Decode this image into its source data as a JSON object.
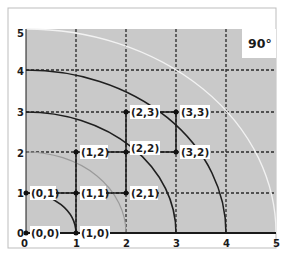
{
  "diagram": {
    "angle_label": "90°",
    "x_ticks": [
      "0",
      "1",
      "2",
      "3",
      "4",
      "5"
    ],
    "y_ticks": [
      "0",
      "1",
      "2",
      "3",
      "4",
      "5"
    ],
    "points": [
      {
        "label": "(0,0)",
        "x": 0,
        "y": 0
      },
      {
        "label": "(1,0)",
        "x": 1,
        "y": 0
      },
      {
        "label": "(0,1)",
        "x": 0,
        "y": 1
      },
      {
        "label": "(1,1)",
        "x": 1,
        "y": 1
      },
      {
        "label": "(2,1)",
        "x": 2,
        "y": 1
      },
      {
        "label": "(1,2)",
        "x": 1,
        "y": 2
      },
      {
        "label": "(2,2)",
        "x": 2,
        "y": 2
      },
      {
        "label": "(3,2)",
        "x": 3,
        "y": 2
      },
      {
        "label": "(2,3)",
        "x": 2,
        "y": 3
      },
      {
        "label": "(3,3)",
        "x": 3,
        "y": 3
      }
    ],
    "arcs_radii": [
      1,
      2,
      3,
      4,
      5
    ],
    "colors": {
      "plot_background": "#c9c9c9",
      "dark_line": "#1f1f1f",
      "mid_gray_arc": "#9a9a9a",
      "white_arc": "#f2f2f2"
    }
  }
}
